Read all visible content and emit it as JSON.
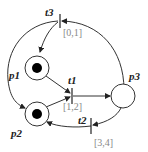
{
  "diagram": {
    "type": "petri-net",
    "places": [
      {
        "id": "p1",
        "label": "p1",
        "tokens": 1
      },
      {
        "id": "p2",
        "label": "p2",
        "tokens": 1
      },
      {
        "id": "p3",
        "label": "p3",
        "tokens": 0
      }
    ],
    "transitions": [
      {
        "id": "t1",
        "label": "t1",
        "interval": "[1,2]"
      },
      {
        "id": "t2",
        "label": "t2",
        "interval": "[3,4]"
      },
      {
        "id": "t3",
        "label": "t3",
        "interval": "[0,1]"
      }
    ],
    "arcs": [
      {
        "from": "p1",
        "to": "t1"
      },
      {
        "from": "p2",
        "to": "t1"
      },
      {
        "from": "t1",
        "to": "p3"
      },
      {
        "from": "p3",
        "to": "t2"
      },
      {
        "from": "t2",
        "to": "p2"
      },
      {
        "from": "p3",
        "to": "t3"
      },
      {
        "from": "t3",
        "to": "p1"
      },
      {
        "from": "t3",
        "to": "p2"
      }
    ],
    "colors": {
      "stroke": "#333333",
      "token": "#000000",
      "interval": "#888888"
    }
  }
}
